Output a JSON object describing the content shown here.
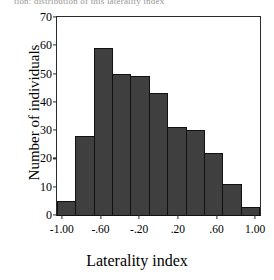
{
  "figure": {
    "top_cropped_text": "tion: distribution of this laterality index"
  },
  "chart_data": {
    "type": "bar",
    "title": "",
    "xlabel": "Laterality index",
    "ylabel": "Number of individuals",
    "categories": [
      "-1.05 to -0.86",
      "-0.86 to -0.67",
      "-0.67 to -0.48",
      "-0.48 to -0.29",
      "-0.29 to -0.10",
      "-0.10 to 0.10",
      "0.10 to 0.29",
      "0.29 to 0.48",
      "0.48 to 0.67",
      "0.67 to 0.86",
      "0.86 to 1.05"
    ],
    "values": [
      5,
      28,
      59,
      50,
      49,
      43,
      31,
      30,
      22,
      11,
      3
    ],
    "bin_centers": [
      -0.955,
      -0.765,
      -0.575,
      -0.385,
      -0.195,
      0.0,
      0.195,
      0.385,
      0.575,
      0.765,
      0.955
    ],
    "bin_width": 0.19,
    "xlim": [
      -1.05,
      1.05
    ],
    "ylim": [
      0,
      70
    ],
    "xticks": [
      -1.0,
      -0.6,
      -0.2,
      0.2,
      0.6,
      1.0
    ],
    "xtick_labels": [
      "-1.00",
      "-.60",
      "-.20",
      ".20",
      ".60",
      "1.00"
    ],
    "yticks": [
      0,
      10,
      20,
      30,
      40,
      50,
      60,
      70
    ],
    "ytick_labels": [
      "0",
      "10",
      "20",
      "30",
      "40",
      "50",
      "60",
      "70"
    ],
    "grid": false,
    "legend": false,
    "bar_color": "#3f3f3f",
    "bar_edge_color": "#111111",
    "axis_color": "#2b2b2b",
    "background": "#ffffff",
    "n_total": 331
  }
}
